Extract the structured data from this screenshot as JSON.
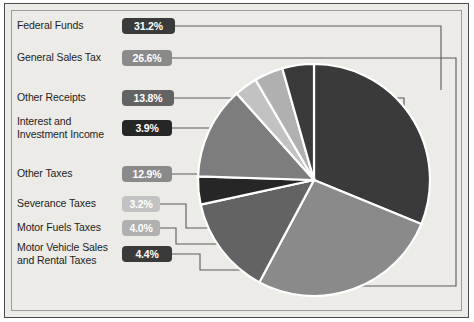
{
  "chart_data": {
    "type": "pie",
    "title": "",
    "legend_position": "left-callouts",
    "grid": false,
    "categories": [
      "Federal Funds",
      "General Sales Tax",
      "Other Receipts",
      "Interest and Investment Income",
      "Other Taxes",
      "Severance Taxes",
      "Motor Fuels Taxes",
      "Motor Vehicle Sales and Rental Taxes"
    ],
    "values": [
      31.2,
      26.6,
      13.8,
      3.9,
      12.9,
      3.2,
      4.0,
      4.4
    ],
    "value_labels": [
      "31.2%",
      "26.6%",
      "13.8%",
      "3.9%",
      "12.9%",
      "3.2%",
      "4.0%",
      "4.4%"
    ],
    "colors": [
      "#3a3a3a",
      "#8a8a8a",
      "#636363",
      "#262626",
      "#7d7d7d",
      "#c2c2c2",
      "#b0b0b0",
      "#3a3a3a"
    ],
    "slice_separator_color": "#ffffff",
    "start_angle_deg": 0,
    "direction": "clockwise"
  },
  "legend": {
    "items": [
      {
        "label": "Federal Funds",
        "value": "31.2%",
        "badge_color": "#3a3a3a"
      },
      {
        "label": "General Sales Tax",
        "value": "26.6%",
        "badge_color": "#8a8a8a"
      },
      {
        "label": "Other Receipts",
        "value": "13.8%",
        "badge_color": "#636363"
      },
      {
        "label": "Interest and\nInvestment Income",
        "value": "3.9%",
        "badge_color": "#262626"
      },
      {
        "label": "Other Taxes",
        "value": "12.9%",
        "badge_color": "#8a8a8a"
      },
      {
        "label": "Severance Taxes",
        "value": "3.2%",
        "badge_color": "#c2c2c2"
      },
      {
        "label": "Motor Fuels Taxes",
        "value": "4.0%",
        "badge_color": "#b0b0b0"
      },
      {
        "label": "Motor Vehicle Sales\nand Rental Taxes",
        "value": "4.4%",
        "badge_color": "#3a3a3a"
      }
    ]
  },
  "style": {
    "background": "#ecebe7",
    "border_color": "#4a4a4a",
    "connector_color": "#5a5a5a",
    "text_color": "#1d1d1d"
  }
}
